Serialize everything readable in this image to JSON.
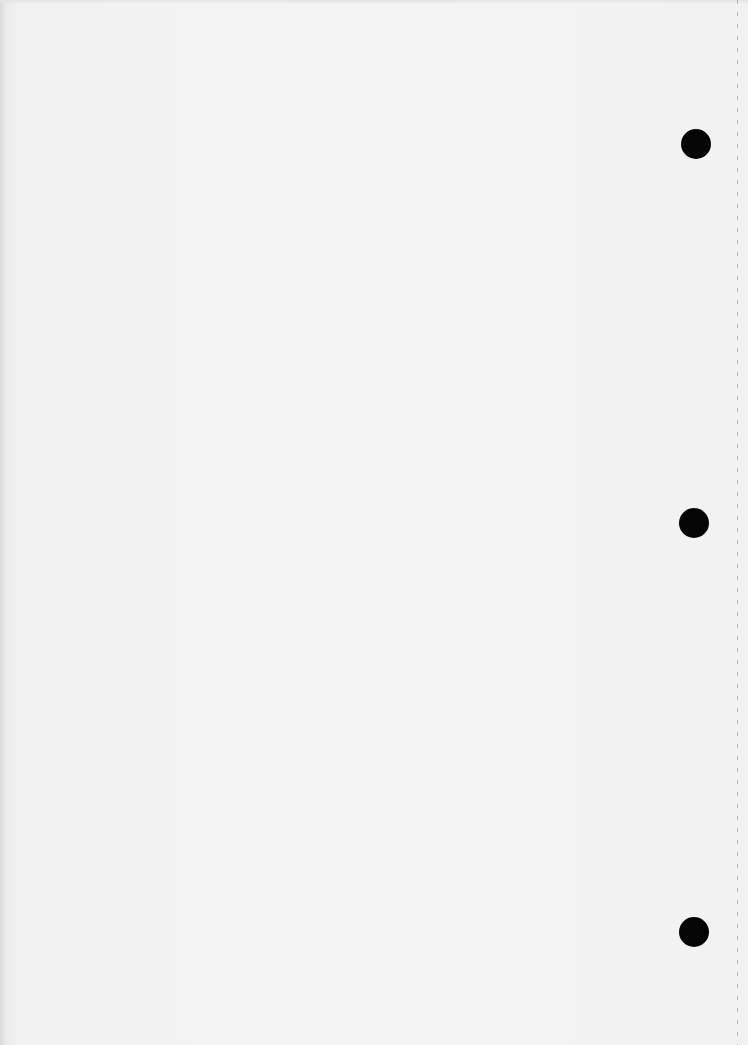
{
  "document": {
    "type": "blank-punched-sheet",
    "text": "",
    "background_color": "#f3f3f3",
    "punch_holes": [
      {
        "name": "top-hole",
        "cx": 696,
        "cy": 144,
        "diameter": 30
      },
      {
        "name": "middle-hole",
        "cx": 694,
        "cy": 523,
        "diameter": 30
      },
      {
        "name": "bottom-hole",
        "cx": 694,
        "cy": 932,
        "diameter": 30
      }
    ],
    "perforation": {
      "x": 737,
      "style": "dashed",
      "color": "#9a9a9a"
    },
    "hole_color": "#050505"
  }
}
